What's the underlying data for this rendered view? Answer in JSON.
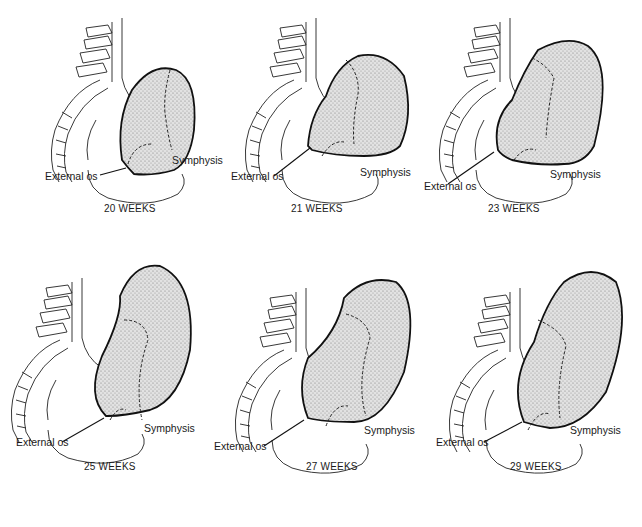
{
  "figure": {
    "labels": {
      "external_os": "External os",
      "symphysis": "Symphysis"
    },
    "panels": [
      {
        "id": "p20",
        "caption": "20 WEEKS",
        "weeks": 20
      },
      {
        "id": "p21",
        "caption": "21 WEEKS",
        "weeks": 21
      },
      {
        "id": "p23",
        "caption": "23 WEEKS",
        "weeks": 23
      },
      {
        "id": "p25",
        "caption": "25 WEEKS",
        "weeks": 25
      },
      {
        "id": "p27",
        "caption": "27 WEEKS",
        "weeks": 27
      },
      {
        "id": "p29",
        "caption": "29 WEEKS",
        "weeks": 29
      }
    ],
    "colors": {
      "line": "#111111",
      "fill_stipple": "#c8c8c8",
      "background": "#ffffff"
    }
  }
}
